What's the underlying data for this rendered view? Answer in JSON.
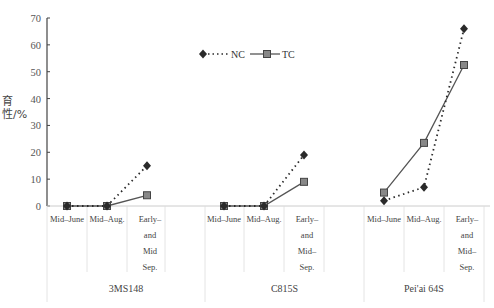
{
  "chart_data": {
    "type": "line",
    "title": "",
    "ylabel": "育性/%",
    "xlabel": "",
    "ylim": [
      0,
      70
    ],
    "yticks": [
      0,
      10,
      20,
      30,
      40,
      50,
      60,
      70
    ],
    "grid": false,
    "legend_position": "top-center",
    "groups": [
      {
        "name": "3MS148",
        "categories": [
          "Mid–June",
          "Mid–Aug.",
          "Early– and Mid Sep."
        ],
        "series": [
          {
            "name": "NC",
            "values": [
              0,
              0,
              15
            ]
          },
          {
            "name": "TC",
            "values": [
              0,
              0,
              4
            ]
          }
        ]
      },
      {
        "name": "C815S",
        "categories": [
          "Mid–June",
          "Mid–Aug.",
          "Early– and Mid– Sep."
        ],
        "series": [
          {
            "name": "NC",
            "values": [
              0,
              0,
              19
            ]
          },
          {
            "name": "TC",
            "values": [
              0,
              0,
              9
            ]
          }
        ]
      },
      {
        "name": "Pei'ai 64S",
        "categories": [
          "Mid–June",
          "Mid–Aug.",
          "Early– and Mid– Sep."
        ],
        "series": [
          {
            "name": "NC",
            "values": [
              2,
              7,
              66
            ]
          },
          {
            "name": "TC",
            "values": [
              5,
              23.5,
              52.5
            ]
          }
        ]
      }
    ],
    "series_styles": [
      {
        "name": "NC",
        "line": "dotted",
        "marker": "diamond",
        "color": "#2b2b2b"
      },
      {
        "name": "TC",
        "line": "solid",
        "marker": "square",
        "color": "#555555"
      }
    ]
  },
  "axis": {
    "ylabel": "育性/%"
  },
  "legend": {
    "nc_label": "NC",
    "tc_label": "TC"
  },
  "categories": {
    "g1": [
      "Mid–June",
      "Mid–Aug.",
      "Early–\nand\nMid\nSep."
    ],
    "g2": [
      "Mid–June",
      "Mid–Aug.",
      "Early–\nand\nMid–\nSep."
    ],
    "g3": [
      "Mid–June",
      "Mid–Aug.",
      "Early–\nand\nMid–\nSep."
    ]
  },
  "groups": {
    "g1": "3MS148",
    "g2": "C815S",
    "g3": "Pei'ai 64S"
  }
}
